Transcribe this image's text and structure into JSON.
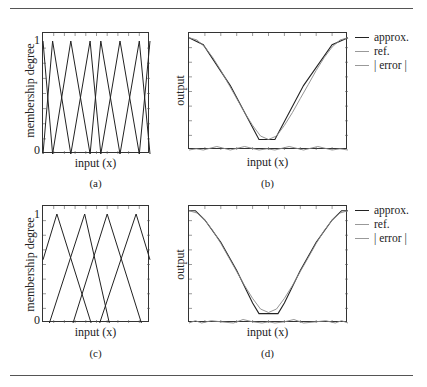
{
  "figure": {
    "panels": [
      {
        "id": "a",
        "caption": "(a)",
        "ylabel": "membership degree",
        "xlabel": "input (x)",
        "ytick_top": "1",
        "ytick_bottom": "0"
      },
      {
        "id": "b",
        "caption": "(b)",
        "ylabel": "output",
        "xlabel": "input (x)"
      },
      {
        "id": "c",
        "caption": "(c)",
        "ylabel": "membership degree",
        "xlabel": "input (x)",
        "ytick_top": "1",
        "ytick_bottom": "0"
      },
      {
        "id": "d",
        "caption": "(d)",
        "ylabel": "output",
        "xlabel": "input (x)"
      }
    ],
    "legend": {
      "approx": "approx.",
      "ref": "ref.",
      "error": "| error |"
    }
  },
  "chart_data": [
    {
      "panel": "(a)",
      "type": "line",
      "title": "",
      "xlabel": "input (x)",
      "ylabel": "membership degree",
      "ylim": [
        0,
        1
      ],
      "xlim": [
        0,
        1
      ],
      "grid": false,
      "description": "8 triangular membership functions, non-uniformly spaced",
      "peaks_x": [
        0.0,
        0.09,
        0.26,
        0.44,
        0.54,
        0.72,
        0.9,
        1.0
      ],
      "series": [
        {
          "name": "mf1",
          "x": [
            0.0,
            0.09
          ],
          "y": [
            1,
            0
          ]
        },
        {
          "name": "mf2",
          "x": [
            0.0,
            0.09,
            0.26
          ],
          "y": [
            0,
            1,
            0
          ]
        },
        {
          "name": "mf3",
          "x": [
            0.09,
            0.26,
            0.44
          ],
          "y": [
            0,
            1,
            0
          ]
        },
        {
          "name": "mf4",
          "x": [
            0.26,
            0.44,
            0.54
          ],
          "y": [
            0,
            1,
            0
          ]
        },
        {
          "name": "mf5",
          "x": [
            0.44,
            0.54,
            0.72
          ],
          "y": [
            0,
            1,
            0
          ]
        },
        {
          "name": "mf6",
          "x": [
            0.54,
            0.72,
            0.9
          ],
          "y": [
            0,
            1,
            0
          ]
        },
        {
          "name": "mf7",
          "x": [
            0.72,
            0.9,
            1.0
          ],
          "y": [
            0,
            1,
            0
          ]
        },
        {
          "name": "mf8",
          "x": [
            0.9,
            1.0
          ],
          "y": [
            0,
            1
          ]
        }
      ]
    },
    {
      "panel": "(b)",
      "type": "line",
      "title": "",
      "xlabel": "input (x)",
      "ylabel": "output",
      "xlim": [
        0,
        1
      ],
      "ylim": [
        0,
        1
      ],
      "grid": false,
      "legend": [
        "approx.",
        "ref.",
        "| error |"
      ],
      "legend_position": "right-outside",
      "series": [
        {
          "name": "approx.",
          "x": [
            0.0,
            0.09,
            0.26,
            0.44,
            0.54,
            0.72,
            0.9,
            1.0
          ],
          "y": [
            0.96,
            0.9,
            0.55,
            0.09,
            0.09,
            0.55,
            0.9,
            0.96
          ]
        },
        {
          "name": "ref.",
          "x": [
            0.0,
            0.05,
            0.1,
            0.15,
            0.2,
            0.25,
            0.3,
            0.35,
            0.4,
            0.45,
            0.5,
            0.55,
            0.6,
            0.65,
            0.7,
            0.75,
            0.8,
            0.85,
            0.9,
            0.95,
            1.0
          ],
          "y": [
            0.96,
            0.94,
            0.88,
            0.79,
            0.68,
            0.56,
            0.44,
            0.32,
            0.21,
            0.12,
            0.09,
            0.12,
            0.21,
            0.32,
            0.44,
            0.56,
            0.68,
            0.79,
            0.88,
            0.94,
            0.96
          ]
        },
        {
          "name": "| error |",
          "x": [
            0.0,
            0.045,
            0.09,
            0.175,
            0.26,
            0.35,
            0.44,
            0.49,
            0.54,
            0.63,
            0.72,
            0.81,
            0.9,
            0.95,
            1.0
          ],
          "y": [
            0.0,
            0.01,
            0.0,
            0.03,
            0.0,
            0.03,
            0.0,
            0.01,
            0.0,
            0.03,
            0.0,
            0.03,
            0.0,
            0.01,
            0.0
          ]
        }
      ]
    },
    {
      "panel": "(c)",
      "type": "line",
      "title": "",
      "xlabel": "input (x)",
      "ylabel": "membership degree",
      "ylim": [
        0,
        1
      ],
      "xlim": [
        0,
        1
      ],
      "grid": false,
      "description": "4 wide overlapping triangular membership functions",
      "series": [
        {
          "name": "mf1",
          "x": [
            0.0,
            0.13,
            0.45
          ],
          "y": [
            0.58,
            1,
            0
          ]
        },
        {
          "name": "mf2",
          "x": [
            0.06,
            0.39,
            0.62
          ],
          "y": [
            0,
            1,
            0
          ]
        },
        {
          "name": "mf3",
          "x": [
            0.28,
            0.6,
            0.92
          ],
          "y": [
            0,
            1,
            0
          ]
        },
        {
          "name": "mf4",
          "x": [
            0.53,
            0.87,
            1.0
          ],
          "y": [
            0,
            1,
            0.58
          ]
        }
      ]
    },
    {
      "panel": "(d)",
      "type": "line",
      "title": "",
      "xlabel": "input (x)",
      "ylabel": "output",
      "xlim": [
        0,
        1
      ],
      "ylim": [
        0,
        1
      ],
      "grid": false,
      "legend": [
        "approx.",
        "ref.",
        "| error |"
      ],
      "legend_position": "right-outside",
      "series": [
        {
          "name": "approx.",
          "x": [
            0.0,
            0.04,
            0.1,
            0.2,
            0.3,
            0.4,
            0.44,
            0.5,
            0.56,
            0.6,
            0.7,
            0.8,
            0.9,
            0.96,
            1.0
          ],
          "y": [
            0.96,
            0.96,
            0.88,
            0.69,
            0.45,
            0.17,
            0.08,
            0.08,
            0.08,
            0.17,
            0.45,
            0.69,
            0.88,
            0.96,
            0.96
          ]
        },
        {
          "name": "ref.",
          "x": [
            0.0,
            0.05,
            0.1,
            0.15,
            0.2,
            0.25,
            0.3,
            0.35,
            0.4,
            0.45,
            0.5,
            0.55,
            0.6,
            0.65,
            0.7,
            0.75,
            0.8,
            0.85,
            0.9,
            0.95,
            1.0
          ],
          "y": [
            0.96,
            0.94,
            0.88,
            0.79,
            0.68,
            0.56,
            0.44,
            0.32,
            0.21,
            0.12,
            0.09,
            0.12,
            0.21,
            0.32,
            0.44,
            0.56,
            0.68,
            0.79,
            0.88,
            0.94,
            0.96
          ]
        },
        {
          "name": "| error |",
          "x": [
            0.0,
            0.04,
            0.08,
            0.14,
            0.2,
            0.28,
            0.34,
            0.4,
            0.46,
            0.5,
            0.54,
            0.6,
            0.66,
            0.72,
            0.8,
            0.86,
            0.92,
            0.96,
            1.0
          ],
          "y": [
            0.0,
            0.02,
            0.0,
            0.02,
            0.01,
            0.0,
            0.03,
            0.01,
            0.0,
            0.01,
            0.0,
            0.01,
            0.03,
            0.0,
            0.01,
            0.02,
            0.0,
            0.02,
            0.0
          ]
        }
      ]
    }
  ]
}
